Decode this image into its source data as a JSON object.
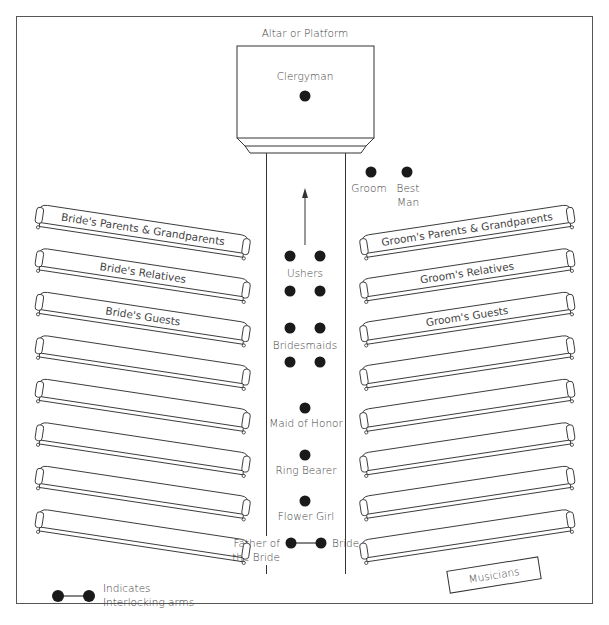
{
  "diagram": {
    "title": "Altar or Platform",
    "colors": {
      "line": "#333333",
      "dot": "#1a1a1a",
      "text": "#444444",
      "background": "#ffffff"
    },
    "altar": {
      "label": "Altar or Platform",
      "officiant": "Clergyman"
    },
    "front_party": [
      {
        "id": "groom",
        "label": "Groom"
      },
      {
        "id": "best-man",
        "label_line1": "Best",
        "label_line2": "Man"
      }
    ],
    "aisle": {
      "direction": "toward altar",
      "groups": [
        {
          "id": "ushers",
          "label": "Ushers",
          "count": 4
        },
        {
          "id": "bridesmaids",
          "label": "Bridesmaids",
          "count": 4
        },
        {
          "id": "maid-of-honor",
          "label": "Maid of Honor",
          "count": 1
        },
        {
          "id": "ring-bearer",
          "label": "Ring Bearer",
          "count": 1
        },
        {
          "id": "flower-girl",
          "label": "Flower Girl",
          "count": 1
        }
      ],
      "procession_end": {
        "left_label_line1": "Father of",
        "left_label_line2": "the Bride",
        "right_label": "Bride"
      }
    },
    "left_pews": [
      {
        "label": "Bride's Parents & Grandparents"
      },
      {
        "label": "Bride's Relatives"
      },
      {
        "label": "Bride's Guests"
      },
      {
        "label": ""
      },
      {
        "label": ""
      },
      {
        "label": ""
      },
      {
        "label": ""
      },
      {
        "label": ""
      }
    ],
    "right_pews": [
      {
        "label": "Groom's Parents & Grandparents"
      },
      {
        "label": "Groom's Relatives"
      },
      {
        "label": "Groom's Guests"
      },
      {
        "label": ""
      },
      {
        "label": ""
      },
      {
        "label": ""
      },
      {
        "label": ""
      },
      {
        "label": ""
      }
    ],
    "musicians": {
      "label": "Musicians"
    },
    "legend": {
      "line1": "Indicates",
      "line2": "Interlocking arms"
    }
  }
}
